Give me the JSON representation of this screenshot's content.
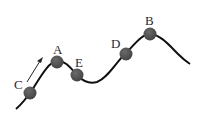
{
  "diagram": {
    "type": "roller-coaster track with labeled positions",
    "colors": {
      "track": "#111111",
      "ball": "#555555",
      "label": "#2a2a2a",
      "arrow": "#222222"
    },
    "points": [
      {
        "id": "C",
        "label": "C"
      },
      {
        "id": "A",
        "label": "A"
      },
      {
        "id": "E",
        "label": "E"
      },
      {
        "id": "D",
        "label": "D"
      },
      {
        "id": "B",
        "label": "B"
      }
    ],
    "arrow": {
      "direction": "up-right along track near C"
    }
  }
}
